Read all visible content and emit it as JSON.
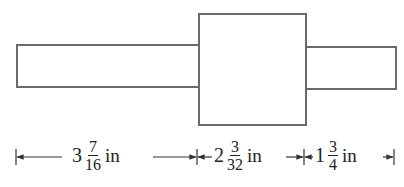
{
  "diagram": {
    "type": "shaft-dimension-drawing",
    "shapes": [
      {
        "name": "left-shaft",
        "x": 16,
        "y": 44,
        "width": 184,
        "height": 44
      },
      {
        "name": "center-hub",
        "x": 198,
        "y": 13,
        "width": 109,
        "height": 113
      },
      {
        "name": "right-shaft",
        "x": 305,
        "y": 46,
        "width": 92,
        "height": 44
      }
    ],
    "dimensions": [
      {
        "name": "left",
        "whole": "3",
        "numerator": "7",
        "denominator": "16",
        "unit": "in",
        "from_x": 16,
        "to_x": 197
      },
      {
        "name": "middle",
        "whole": "2",
        "numerator": "3",
        "denominator": "32",
        "unit": "in",
        "from_x": 197,
        "to_x": 304
      },
      {
        "name": "right",
        "whole": "1",
        "numerator": "3",
        "denominator": "4",
        "unit": "in",
        "from_x": 304,
        "to_x": 394
      }
    ],
    "colors": {
      "outline": "#6a6a6a",
      "text": "#222222",
      "background": "#ffffff"
    }
  }
}
